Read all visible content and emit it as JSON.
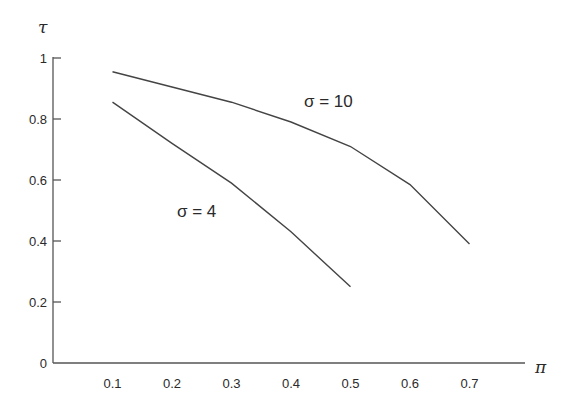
{
  "chart_data": {
    "type": "line",
    "title": "",
    "xlabel": "π",
    "ylabel": "τ",
    "xlim": [
      0,
      0.8
    ],
    "ylim": [
      0,
      1
    ],
    "grid": false,
    "x_ticks": [
      "0.1",
      "0.2",
      "0.3",
      "0.4",
      "0.5",
      "0.6",
      "0.7"
    ],
    "y_ticks": [
      "0",
      "0.2",
      "0.4",
      "0.6",
      "0.8",
      "1"
    ],
    "series": [
      {
        "name": "σ = 10",
        "x": [
          0.1,
          0.2,
          0.3,
          0.4,
          0.5,
          0.6,
          0.7
        ],
        "values": [
          0.955,
          0.905,
          0.855,
          0.79,
          0.71,
          0.585,
          0.39
        ]
      },
      {
        "name": "σ = 4",
        "x": [
          0.1,
          0.2,
          0.3,
          0.4,
          0.5
        ],
        "values": [
          0.855,
          0.72,
          0.59,
          0.43,
          0.25
        ]
      }
    ],
    "annotations": [
      {
        "text": "σ = 10",
        "near_x": 0.45,
        "near_y": 0.85
      },
      {
        "text": "σ = 4",
        "near_x": 0.25,
        "near_y": 0.5
      }
    ]
  }
}
